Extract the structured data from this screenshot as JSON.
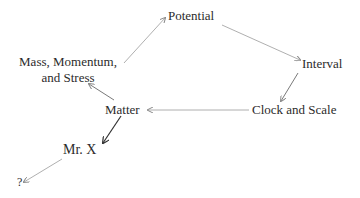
{
  "diagram": {
    "nodes": [
      {
        "id": "potential",
        "label": "Potential"
      },
      {
        "id": "interval",
        "label": "Interval"
      },
      {
        "id": "clock",
        "label": "Clock and Scale"
      },
      {
        "id": "matter",
        "label": "Matter"
      },
      {
        "id": "mass",
        "label_line1": "Mass, Momentum,",
        "label_line2": "and Stress"
      },
      {
        "id": "mrx",
        "label": "Mr. X"
      },
      {
        "id": "unknown",
        "label": "?"
      }
    ],
    "edges": [
      {
        "from": "mass",
        "to": "potential"
      },
      {
        "from": "potential",
        "to": "interval"
      },
      {
        "from": "interval",
        "to": "clock"
      },
      {
        "from": "clock",
        "to": "matter"
      },
      {
        "from": "matter",
        "to": "mass"
      },
      {
        "from": "matter",
        "to": "mrx"
      },
      {
        "from": "mrx",
        "to": "unknown"
      }
    ],
    "colors": {
      "text": "#2b2b2b",
      "arrow_light": "#9a9a9a",
      "arrow_dark": "#3a3a3a"
    }
  }
}
